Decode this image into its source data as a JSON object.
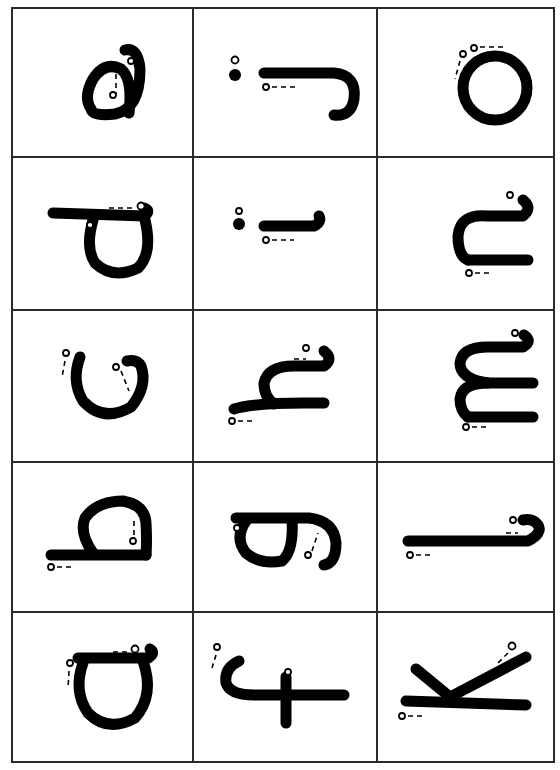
{
  "worksheet": {
    "layout": {
      "columns": 3,
      "rows": 5
    },
    "cells": [
      {
        "row": 0,
        "col": 0,
        "letter": "e"
      },
      {
        "row": 0,
        "col": 1,
        "letter": "j"
      },
      {
        "row": 0,
        "col": 2,
        "letter": "o"
      },
      {
        "row": 1,
        "col": 0,
        "letter": "d"
      },
      {
        "row": 1,
        "col": 1,
        "letter": "i"
      },
      {
        "row": 1,
        "col": 2,
        "letter": "n"
      },
      {
        "row": 2,
        "col": 0,
        "letter": "c"
      },
      {
        "row": 2,
        "col": 1,
        "letter": "h"
      },
      {
        "row": 2,
        "col": 2,
        "letter": "m"
      },
      {
        "row": 3,
        "col": 0,
        "letter": "b"
      },
      {
        "row": 3,
        "col": 1,
        "letter": "g"
      },
      {
        "row": 3,
        "col": 2,
        "letter": "l"
      },
      {
        "row": 4,
        "col": 0,
        "letter": "a"
      },
      {
        "row": 4,
        "col": 1,
        "letter": "f"
      },
      {
        "row": 4,
        "col": 2,
        "letter": "k"
      }
    ],
    "orientation": "letters rotated 90 degrees",
    "stroke_color": "#000000",
    "grid_color": "#2a2a2a"
  }
}
